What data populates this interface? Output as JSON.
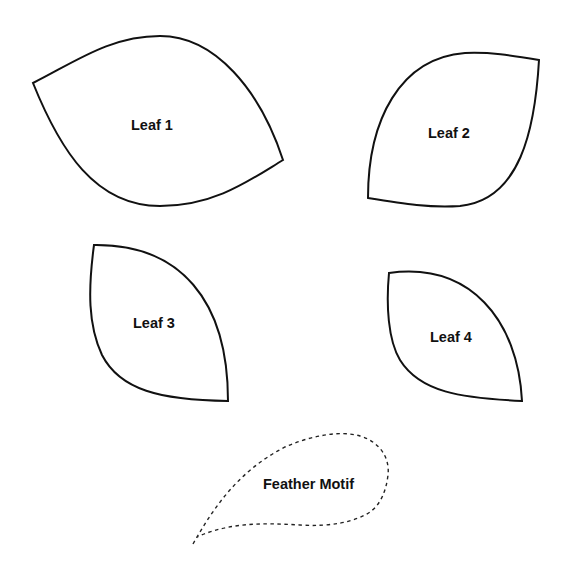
{
  "diagram": {
    "title": "",
    "background_color": "#ffffff",
    "stroke_color": "#111111",
    "shapes": [
      {
        "id": "leaf-1",
        "label": "Leaf 1",
        "style": "solid"
      },
      {
        "id": "leaf-2",
        "label": "Leaf 2",
        "style": "solid"
      },
      {
        "id": "leaf-3",
        "label": "Leaf 3",
        "style": "solid"
      },
      {
        "id": "leaf-4",
        "label": "Leaf 4",
        "style": "solid"
      },
      {
        "id": "feather-motif",
        "label": "Feather Motif",
        "style": "dashed"
      }
    ]
  }
}
